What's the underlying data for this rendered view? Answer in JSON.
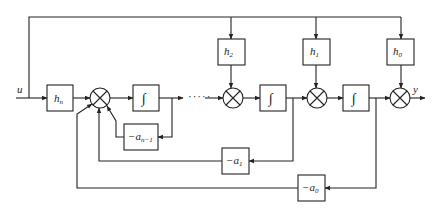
{
  "diagram": {
    "title": "",
    "type": "block-diagram",
    "input_label": "u",
    "output_label": "y",
    "ellipsis": "·····",
    "blocks": {
      "hn": {
        "base": "h",
        "sub": "n"
      },
      "h2": {
        "base": "h",
        "sub": "2"
      },
      "h1": {
        "base": "h",
        "sub": "1"
      },
      "h0": {
        "base": "h",
        "sub": "0"
      },
      "an1": {
        "base": "−a",
        "sub": "n−1"
      },
      "a1": {
        "base": "−a",
        "sub": "1"
      },
      "a0": {
        "base": "−a",
        "sub": "0"
      },
      "int1": {
        "symbol": "∫"
      },
      "int2": {
        "symbol": "∫"
      },
      "int3": {
        "symbol": "∫"
      }
    },
    "summing_junctions": [
      "sum1",
      "sum2",
      "sum3",
      "sum4"
    ],
    "stroke_color": "#222222",
    "background": "#ffffff"
  }
}
